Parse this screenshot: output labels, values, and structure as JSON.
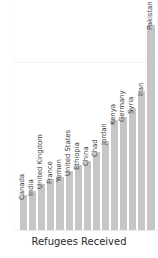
{
  "chart_data": {
    "type": "bar",
    "title": "",
    "subtitle": "",
    "xlabel": "Refugees Received",
    "ylabel": "",
    "orientation": "vertical",
    "grid": true,
    "legend": false,
    "sorted": "ascending",
    "note": "Final bar (Pakistan) is clipped by the right edge of the figure; its label is cut off at the top of the image.",
    "categories": [
      "Canada",
      "India",
      "United Kingdom",
      "France",
      "Yemen",
      "United States",
      "Ethiopia",
      "China",
      "Chad",
      "Jordan",
      "Kenya",
      "Germany",
      "Syria",
      "Iran",
      "Pakistan"
    ],
    "values": [
      24,
      27,
      32,
      35,
      37,
      41,
      45,
      48,
      54,
      62,
      76,
      78,
      84,
      96,
      142
    ],
    "ylim": [
      0,
      160
    ],
    "gridlines": [
      117
    ],
    "bar_color": "#c6c6c6",
    "background_color": "#ffffff",
    "label_color": "#3a3a3a",
    "axis_title_color": "#2b2b2b"
  },
  "axis": {
    "x_title": "Refugees Received"
  }
}
